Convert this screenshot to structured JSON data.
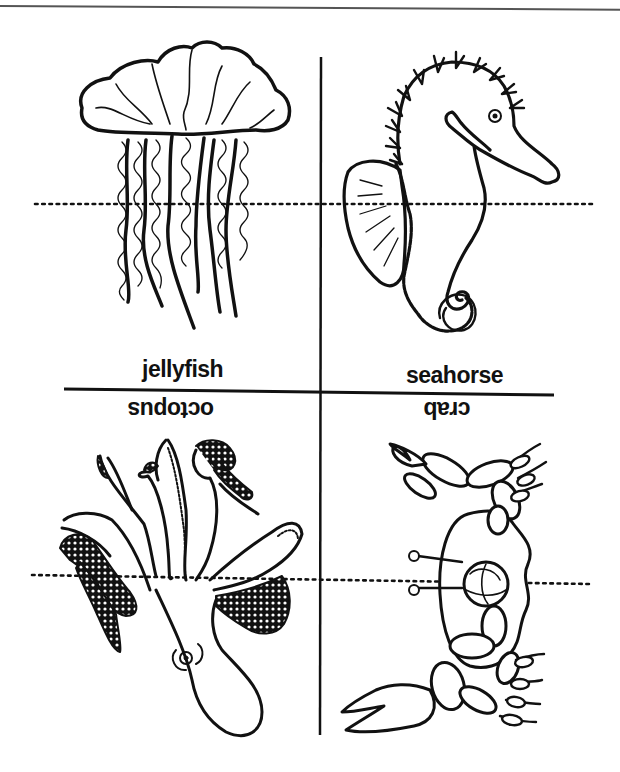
{
  "sheet": {
    "type": "foldable-activity-sheet",
    "colors": {
      "ink": "#111111",
      "paper": "#ffffff",
      "border": "#555555"
    }
  },
  "panels": [
    {
      "id": "jellyfish",
      "label": "jellyfish",
      "position": "top-left",
      "orientation": "upright"
    },
    {
      "id": "seahorse",
      "label": "seahorse",
      "position": "top-right",
      "orientation": "upright"
    },
    {
      "id": "octopus",
      "label": "octopus",
      "position": "bottom-left",
      "orientation": "upside-down"
    },
    {
      "id": "crab",
      "label": "crab",
      "position": "bottom-right",
      "orientation": "upside-down"
    }
  ],
  "guides": {
    "cut_lines": [
      "vertical-center",
      "horizontal-center"
    ],
    "fold_lines": [
      "top-dotted",
      "bottom-dotted"
    ]
  }
}
